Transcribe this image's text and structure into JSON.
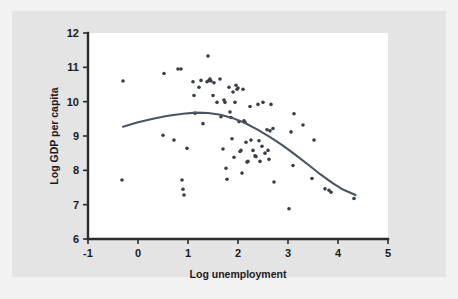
{
  "figure": {
    "background_color": "#f2f2f2",
    "panel_color": "#e4e4e4",
    "plot_area_color": "#ffffff"
  },
  "chart_data": {
    "type": "scatter",
    "title": "",
    "subtitle": "",
    "xlabel": "Log unemployment",
    "ylabel": "Log GDP per capita",
    "xlim": [
      -1,
      5
    ],
    "ylim": [
      6,
      12
    ],
    "xticks": [
      -1,
      0,
      1,
      2,
      3,
      4,
      5
    ],
    "xtick_labels": [
      "-1",
      "0",
      "1",
      "2",
      "3",
      "4",
      "5"
    ],
    "yticks": [
      6,
      7,
      8,
      9,
      10,
      11,
      12
    ],
    "ytick_labels": [
      "6",
      "7",
      "8",
      "9",
      "10",
      "11",
      "12"
    ],
    "grid": false,
    "legend": null,
    "point_color": "#3a3f46",
    "curve_color": "#4b5560",
    "points": [
      [
        -0.3,
        10.6
      ],
      [
        -0.32,
        7.72
      ],
      [
        0.52,
        10.82
      ],
      [
        0.5,
        9.02
      ],
      [
        0.72,
        8.88
      ],
      [
        0.8,
        10.95
      ],
      [
        0.86,
        10.95
      ],
      [
        0.88,
        7.72
      ],
      [
        0.9,
        7.45
      ],
      [
        0.92,
        7.28
      ],
      [
        0.98,
        8.64
      ],
      [
        1.1,
        10.58
      ],
      [
        1.12,
        10.18
      ],
      [
        1.14,
        9.66
      ],
      [
        1.22,
        10.42
      ],
      [
        1.26,
        10.62
      ],
      [
        1.3,
        9.36
      ],
      [
        1.38,
        10.58
      ],
      [
        1.4,
        11.33
      ],
      [
        1.42,
        10.62
      ],
      [
        1.44,
        10.66
      ],
      [
        1.46,
        10.6
      ],
      [
        1.5,
        10.18
      ],
      [
        1.52,
        10.55
      ],
      [
        1.58,
        9.98
      ],
      [
        1.64,
        10.66
      ],
      [
        1.66,
        9.56
      ],
      [
        1.7,
        8.62
      ],
      [
        1.72,
        10.05
      ],
      [
        1.74,
        9.98
      ],
      [
        1.76,
        8.06
      ],
      [
        1.78,
        7.74
      ],
      [
        1.82,
        10.42
      ],
      [
        1.84,
        9.7
      ],
      [
        1.86,
        9.54
      ],
      [
        1.88,
        8.92
      ],
      [
        1.9,
        10.28
      ],
      [
        1.92,
        8.38
      ],
      [
        1.94,
        9.98
      ],
      [
        1.96,
        10.48
      ],
      [
        1.98,
        10.36
      ],
      [
        2.0,
        10.4
      ],
      [
        2.02,
        9.42
      ],
      [
        2.04,
        8.55
      ],
      [
        2.06,
        8.58
      ],
      [
        2.08,
        7.92
      ],
      [
        2.1,
        10.36
      ],
      [
        2.12,
        9.44
      ],
      [
        2.14,
        9.4
      ],
      [
        2.16,
        8.82
      ],
      [
        2.18,
        8.24
      ],
      [
        2.2,
        8.26
      ],
      [
        2.24,
        9.86
      ],
      [
        2.26,
        8.88
      ],
      [
        2.3,
        8.58
      ],
      [
        2.34,
        8.42
      ],
      [
        2.36,
        8.4
      ],
      [
        2.4,
        9.92
      ],
      [
        2.42,
        8.86
      ],
      [
        2.44,
        8.26
      ],
      [
        2.48,
        8.7
      ],
      [
        2.5,
        9.98
      ],
      [
        2.54,
        8.5
      ],
      [
        2.58,
        9.18
      ],
      [
        2.6,
        8.58
      ],
      [
        2.62,
        8.32
      ],
      [
        2.64,
        9.15
      ],
      [
        2.66,
        9.92
      ],
      [
        2.7,
        9.22
      ],
      [
        2.72,
        7.66
      ],
      [
        3.02,
        6.88
      ],
      [
        3.06,
        9.12
      ],
      [
        3.1,
        8.14
      ],
      [
        3.12,
        9.65
      ],
      [
        3.3,
        9.32
      ],
      [
        3.48,
        7.76
      ],
      [
        3.52,
        8.88
      ],
      [
        3.74,
        7.46
      ],
      [
        3.82,
        7.42
      ],
      [
        3.86,
        7.36
      ],
      [
        4.32,
        7.18
      ]
    ],
    "fit_curve": {
      "description": "quadratic lowess fit",
      "x_start": -0.3,
      "x_end": 4.35,
      "points": [
        [
          -0.3,
          9.27
        ],
        [
          0.0,
          9.4
        ],
        [
          0.3,
          9.5
        ],
        [
          0.6,
          9.59
        ],
        [
          0.9,
          9.65
        ],
        [
          1.15,
          9.68
        ],
        [
          1.4,
          9.67
        ],
        [
          1.65,
          9.62
        ],
        [
          1.9,
          9.52
        ],
        [
          2.15,
          9.37
        ],
        [
          2.4,
          9.18
        ],
        [
          2.65,
          8.96
        ],
        [
          2.9,
          8.72
        ],
        [
          3.15,
          8.45
        ],
        [
          3.4,
          8.17
        ],
        [
          3.65,
          7.88
        ],
        [
          3.9,
          7.62
        ],
        [
          4.1,
          7.44
        ],
        [
          4.35,
          7.28
        ]
      ]
    }
  }
}
